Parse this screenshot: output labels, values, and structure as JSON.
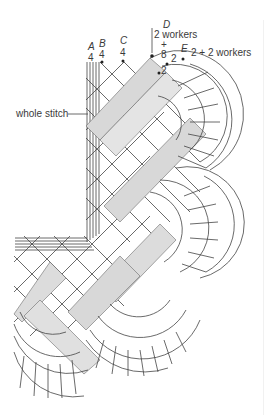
{
  "figure": {
    "type": "bobbin lace pricking / working diagram",
    "line_color": "#444444",
    "background": "#ffffff"
  },
  "labels": {
    "A": {
      "letter": "A",
      "count": "4"
    },
    "B": {
      "letter": "B",
      "count": "4"
    },
    "C": {
      "letter": "C",
      "count": "4"
    },
    "D": {
      "letter": "D",
      "line1": "2 workers",
      "plus": "+",
      "count": "8"
    },
    "E": {
      "letter": "E",
      "text": "2 + 2 workers"
    },
    "inner_pairs": [
      "2",
      "2"
    ],
    "callout": "whole stitch"
  }
}
